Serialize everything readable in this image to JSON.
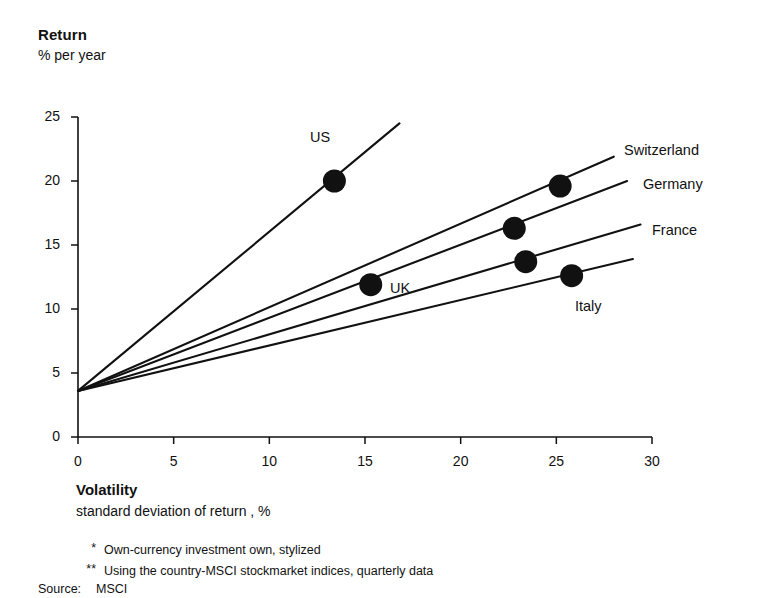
{
  "header": {
    "title": "Return",
    "subtitle": "% per year"
  },
  "axis": {
    "x_title": "Volatility",
    "x_subtitle": "standard deviation of return  , %",
    "y_ticks": [
      "0",
      "5",
      "10",
      "15",
      "20",
      "25"
    ],
    "x_ticks": [
      "0",
      "5",
      "10",
      "15",
      "20",
      "25",
      "30"
    ]
  },
  "footnotes": [
    {
      "marker": "*",
      "text": "Own-currency investment own, stylized"
    },
    {
      "marker": "**",
      "text": "Using the country-MSCI stockmarket indices, quarterly data"
    }
  ],
  "source": {
    "label": "Source:",
    "value": "MSCI"
  },
  "colors": {
    "ink": "#111111",
    "background": "#ffffff"
  },
  "chart_data": {
    "type": "scatter",
    "title": "Return",
    "subtitle": "% per year",
    "xlabel": "Volatility",
    "xlabel_sub": "standard deviation of return  , %",
    "ylabel": "Return",
    "ylabel_sub": "% per year",
    "xlim": [
      0,
      30
    ],
    "ylim": [
      0,
      25
    ],
    "xticks": [
      0,
      5,
      10,
      15,
      20,
      25,
      30
    ],
    "yticks": [
      0,
      5,
      10,
      15,
      20,
      25
    ],
    "grid": false,
    "legend": "inline-labels",
    "risk_free_intercept": 3.6,
    "points": [
      {
        "name": "US",
        "x": 13.4,
        "y": 20.0,
        "label_dx": -6,
        "label_dy": -30
      },
      {
        "name": "UK",
        "x": 15.3,
        "y": 11.9,
        "label_dx": 30,
        "label_dy": 5
      },
      {
        "name": "Switzerland",
        "x": 25.2,
        "y": 19.6,
        "label_dx": 0,
        "label_dy": 0
      },
      {
        "name": "Germany",
        "x": 22.8,
        "y": 16.3,
        "label_dx": 0,
        "label_dy": 0
      },
      {
        "name": "France",
        "x": 23.4,
        "y": 13.7,
        "label_dx": 0,
        "label_dy": 0
      },
      {
        "name": "Italy",
        "x": 25.8,
        "y": 12.6,
        "label_dx": 26,
        "label_dy": 31
      }
    ],
    "lines": [
      {
        "name": "US",
        "x0": 0,
        "y0": 3.6,
        "x1": 16.8,
        "y1": 24.5
      },
      {
        "name": "Switzerland",
        "x0": 0,
        "y0": 3.6,
        "x1": 28.0,
        "y1": 21.9
      },
      {
        "name": "Germany",
        "x0": 0,
        "y0": 3.6,
        "x1": 28.7,
        "y1": 20.0
      },
      {
        "name": "France",
        "x0": 0,
        "y0": 3.6,
        "x1": 29.4,
        "y1": 16.6
      },
      {
        "name": "Italy",
        "x0": 0,
        "y0": 3.6,
        "x1": 29.0,
        "y1": 13.9
      }
    ],
    "series_labels": [
      {
        "name": "Switzerland",
        "text": "Switzerland"
      },
      {
        "name": "Germany",
        "text": "Germany"
      },
      {
        "name": "France",
        "text": "France"
      },
      {
        "name": "Italy",
        "text": "Italy"
      },
      {
        "name": "US",
        "text": "US"
      },
      {
        "name": "UK",
        "text": "UK"
      }
    ]
  }
}
